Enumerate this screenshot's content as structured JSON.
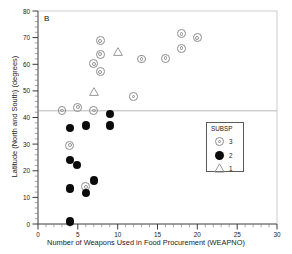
{
  "panel": {
    "label": "B"
  },
  "axes": {
    "xlabel": "Number of Weapons Used in Food Procurement (WEAPNO)",
    "ylabel": "Latitude (North and South) (degrees)",
    "x_ticks": [
      "0",
      "5",
      "10",
      "15",
      "20",
      "25",
      "30"
    ],
    "y_ticks": [
      "0",
      "10",
      "20",
      "30",
      "40",
      "50",
      "60",
      "70",
      "80"
    ]
  },
  "legend": {
    "title": "SUBSP",
    "entries": [
      {
        "symbol": "open-circle-target-icon",
        "label": "3"
      },
      {
        "symbol": "filled-circle-icon",
        "label": "2"
      },
      {
        "symbol": "open-triangle-icon",
        "label": "1"
      }
    ]
  },
  "chart_data": {
    "type": "scatter",
    "title": "B",
    "xlabel": "Number of Weapons Used in Food Procurement (WEAPNO)",
    "ylabel": "Latitude (North and South) (degrees)",
    "xlim": [
      0,
      30
    ],
    "ylim": [
      0,
      80
    ],
    "xticks": [
      0,
      5,
      10,
      15,
      20,
      25,
      30
    ],
    "yticks": [
      0,
      10,
      20,
      30,
      40,
      50,
      60,
      70,
      80
    ],
    "grid": false,
    "minor_ticks": true,
    "legend_title": "SUBSP",
    "legend_position": "right-middle",
    "reference_lines": [
      {
        "orientation": "horizontal",
        "y": 42.5,
        "color": "#9a9a9a"
      }
    ],
    "series": [
      {
        "name": "3",
        "marker": "open-circle-target",
        "color": "#8c8c8c",
        "points": [
          {
            "x": 7.8,
            "y": 68.8
          },
          {
            "x": 7.8,
            "y": 63.8
          },
          {
            "x": 7.0,
            "y": 60.2
          },
          {
            "x": 7.8,
            "y": 57.2
          },
          {
            "x": 12.0,
            "y": 47.9
          },
          {
            "x": 13.0,
            "y": 62.0
          },
          {
            "x": 16.0,
            "y": 62.2
          },
          {
            "x": 18.0,
            "y": 71.5
          },
          {
            "x": 18.0,
            "y": 66.0
          },
          {
            "x": 20.0,
            "y": 70.0
          },
          {
            "x": 3.0,
            "y": 42.6
          },
          {
            "x": 5.0,
            "y": 43.8
          },
          {
            "x": 7.0,
            "y": 42.6
          },
          {
            "x": 4.0,
            "y": 29.6
          },
          {
            "x": 6.0,
            "y": 14.0
          }
        ]
      },
      {
        "name": "2",
        "marker": "filled-circle",
        "color": "#0b0b0b",
        "points": [
          {
            "x": 9.0,
            "y": 41.4
          },
          {
            "x": 4.0,
            "y": 36.0
          },
          {
            "x": 6.0,
            "y": 37.0
          },
          {
            "x": 9.0,
            "y": 37.0
          },
          {
            "x": 4.0,
            "y": 24.0
          },
          {
            "x": 4.9,
            "y": 22.2
          },
          {
            "x": 4.0,
            "y": 13.3
          },
          {
            "x": 6.0,
            "y": 11.6
          },
          {
            "x": 7.0,
            "y": 16.4
          },
          {
            "x": 4.0,
            "y": 1.0
          }
        ]
      },
      {
        "name": "1",
        "marker": "open-triangle",
        "color": "#8c8c8c",
        "points": [
          {
            "x": 10.0,
            "y": 64.6
          },
          {
            "x": 7.0,
            "y": 49.6
          }
        ]
      }
    ]
  }
}
